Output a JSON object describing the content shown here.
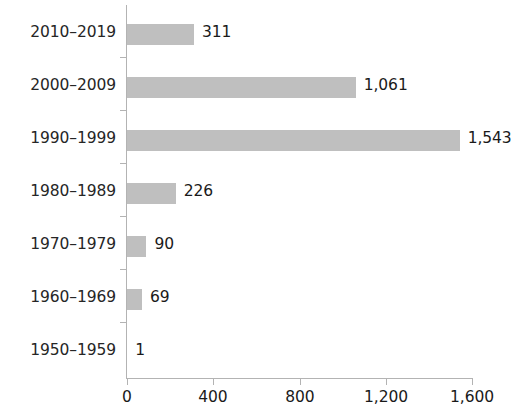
{
  "chart_data": {
    "type": "bar",
    "orientation": "horizontal",
    "title": "",
    "subtitle": "",
    "xlabel": "",
    "ylabel": "",
    "categories": [
      "2010–2019",
      "2000–2009",
      "1990–1999",
      "1980–1989",
      "1970–1979",
      "1960–1969",
      "1950–1959"
    ],
    "values": [
      311,
      1061,
      1543,
      226,
      90,
      69,
      1
    ],
    "data_labels": [
      "311",
      "1,061",
      "1,543",
      "226",
      "90",
      "69",
      "1"
    ],
    "xlim": [
      0,
      1600
    ],
    "xticks": [
      0,
      400,
      800,
      1200,
      1600
    ],
    "xtick_labels": [
      "0",
      "400",
      "800",
      "1,200",
      "1,600"
    ],
    "grid": false,
    "legend": null,
    "bar_color": "#bfbfbf",
    "axis_color": "#b3b3b3",
    "text_color": "#1a1a1a"
  }
}
